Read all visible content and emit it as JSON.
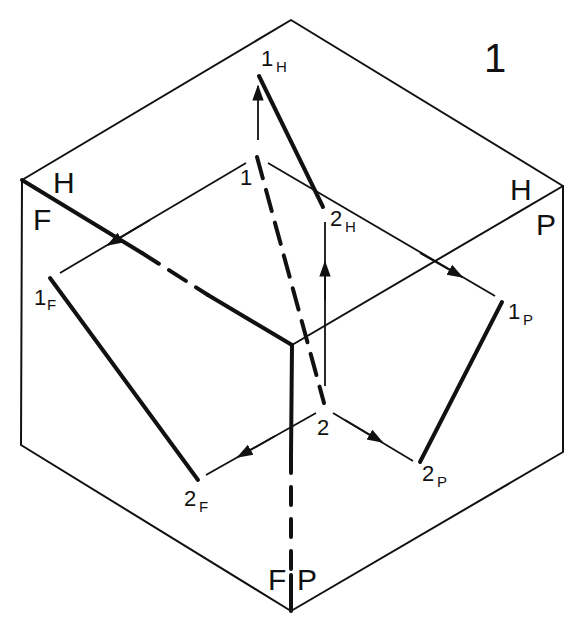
{
  "figure": {
    "number": "1",
    "type": "isometric projection of a line onto three principal planes"
  },
  "planes": {
    "top_left": {
      "upper": "H",
      "lower": "F"
    },
    "top_right": {
      "upper": "H",
      "lower": "P"
    },
    "bottom": {
      "left": "F",
      "right": "P"
    }
  },
  "points": {
    "p1": {
      "main": "1",
      "sub": ""
    },
    "p2": {
      "main": "2",
      "sub": ""
    },
    "p1H": {
      "main": "1",
      "sub": "H"
    },
    "p2H": {
      "main": "2",
      "sub": "H"
    },
    "p1F": {
      "main": "1",
      "sub": "F"
    },
    "p2F": {
      "main": "2",
      "sub": "F"
    },
    "p1P": {
      "main": "1",
      "sub": "P"
    },
    "p2P": {
      "main": "2",
      "sub": "P"
    }
  },
  "colors": {
    "ink": "#111111",
    "background": "#ffffff"
  }
}
